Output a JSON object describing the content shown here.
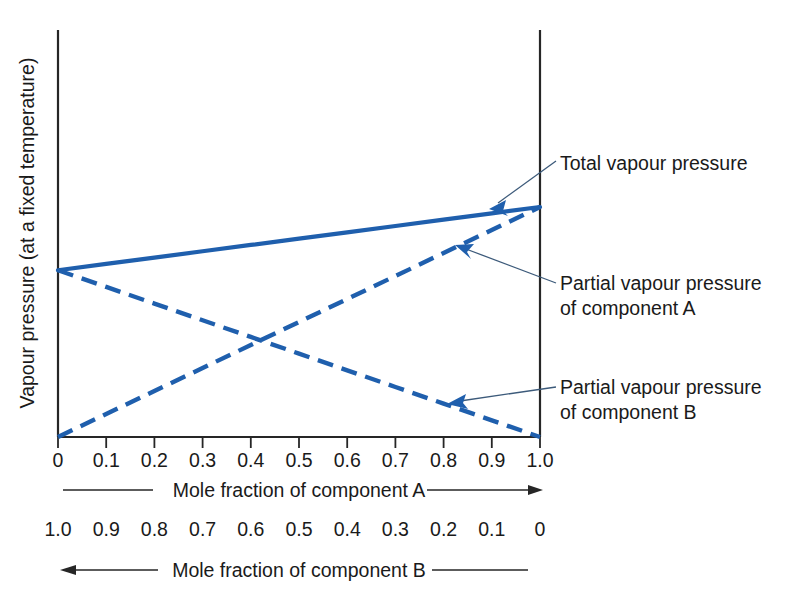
{
  "chart_data": {
    "type": "line",
    "title": "",
    "xlabel": "Mole fraction of component A",
    "xlabel_secondary": "Mole fraction of component B",
    "ylabel": "Vapour pressure (at a fixed temperature)",
    "x": [
      0,
      0.1,
      0.2,
      0.3,
      0.4,
      0.5,
      0.6,
      0.7,
      0.8,
      0.9,
      1.0
    ],
    "xticklabels": [
      "0",
      "0.1",
      "0.2",
      "0.3",
      "0.4",
      "0.5",
      "0.6",
      "0.7",
      "0.8",
      "0.9",
      "1.0"
    ],
    "xticklabels_secondary": [
      "1.0",
      "0.9",
      "0.8",
      "0.7",
      "0.6",
      "0.5",
      "0.4",
      "0.3",
      "0.2",
      "0.1",
      "0"
    ],
    "xlim": [
      0,
      1.0
    ],
    "ylim": [
      0,
      1.0
    ],
    "yticklabels": [],
    "grid": false,
    "legend": "annotations",
    "series": [
      {
        "name": "Total vapour pressure",
        "style": "solid",
        "color": "#1f5fad",
        "values": [
          0.725,
          0.7525,
          0.78,
          0.8075,
          0.835,
          0.8625,
          0.89,
          0.9175,
          0.945,
          0.9725,
          1.0
        ]
      },
      {
        "name": "Partial vapour pressure of component A",
        "style": "dashed",
        "color": "#1f5fad",
        "values": [
          0,
          0.1,
          0.2,
          0.3,
          0.4,
          0.5,
          0.6,
          0.7,
          0.8,
          0.9,
          1.0
        ]
      },
      {
        "name": "Partial vapour pressure of component B",
        "style": "dashed",
        "color": "#1f5fad",
        "values": [
          0.725,
          0.6525,
          0.58,
          0.5075,
          0.435,
          0.3625,
          0.29,
          0.2175,
          0.145,
          0.0725,
          0
        ]
      }
    ],
    "annotations": [
      {
        "text": "Total vapour pressure",
        "points_to_series": "Total vapour pressure",
        "points_to_x": 0.9
      },
      {
        "text_line1": "Partial vapour pressure",
        "text_line2": "of component A",
        "points_to_series": "Partial vapour pressure of component A",
        "points_to_x": 0.82
      },
      {
        "text_line1": "Partial vapour pressure",
        "text_line2": "of component B",
        "points_to_series": "Partial vapour pressure of component B",
        "points_to_x": 0.81
      }
    ]
  },
  "labels": {
    "y_axis": "Vapour pressure (at a fixed temperature)",
    "x_axis_primary": "Mole fraction of component A",
    "x_axis_secondary": "Mole fraction of component B",
    "annotation_total": "Total vapour pressure",
    "annotation_partial_a_line1": "Partial vapour pressure",
    "annotation_partial_a_line2": "of component A",
    "annotation_partial_b_line1": "Partial vapour pressure",
    "annotation_partial_b_line2": "of component B"
  },
  "ticks_top": [
    "0",
    "0.1",
    "0.2",
    "0.3",
    "0.4",
    "0.5",
    "0.6",
    "0.7",
    "0.8",
    "0.9",
    "1.0"
  ],
  "ticks_bottom": [
    "1.0",
    "0.9",
    "0.8",
    "0.7",
    "0.6",
    "0.5",
    "0.4",
    "0.3",
    "0.2",
    "0.1",
    "0"
  ],
  "colors": {
    "series_blue": "#1f5fad",
    "axis_black": "#262626",
    "leader_line": "#3c5a7a"
  }
}
